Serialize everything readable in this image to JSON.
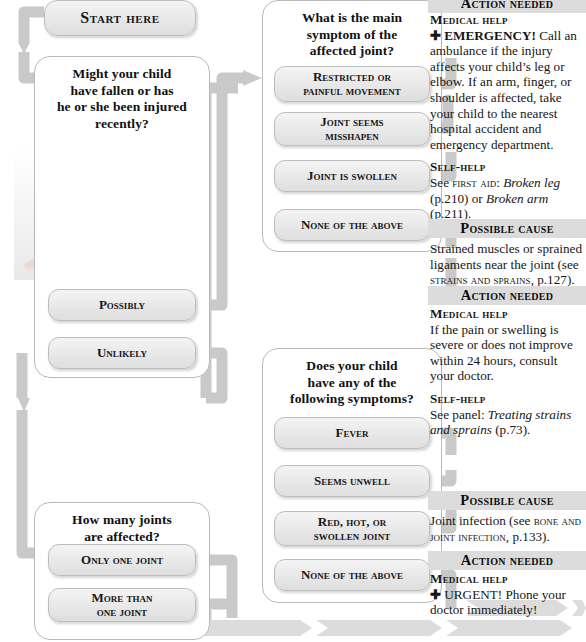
{
  "flowchart": {
    "start_label": "Start here",
    "questions": [
      {
        "id": "injury",
        "title": "Might your child\nhave fallen or has\nhe or she been injured\nrecently?",
        "answers": [
          "Possibly",
          "Unlikely"
        ]
      },
      {
        "id": "main-symptom",
        "title": "What is the main\nsymptom of the\naffected joint?",
        "answers": [
          "Restricted or\npainful movement",
          "Joint seems\nmisshapen",
          "Joint is swollen",
          "None of the above"
        ]
      },
      {
        "id": "following-symptoms",
        "title": "Does your child\nhave any of the\nfollowing symptoms?",
        "answers": [
          "Fever",
          "Seems unwell",
          "Red, hot, or\nswollen joint",
          "None of the above"
        ]
      },
      {
        "id": "joint-count",
        "title": "How many joints\nare affected?",
        "answers": [
          "Only one joint",
          "More than\none joint"
        ]
      }
    ],
    "photo_alt": "Woman kneeling beside an injured girl sitting on the floor"
  },
  "advice": [
    {
      "id": "action-emergency",
      "header": "Action needed",
      "blocks": [
        {
          "label": "Medical help",
          "symbol": "✚",
          "lead": "EMERGENCY!",
          "text": " Call an ambulance if the injury affects your child’s leg or elbow. If an arm, finger, or shoulder is affected, take your child to the nearest hospital accident and emergency department."
        },
        {
          "label": "Self-help",
          "text_parts": [
            {
              "t": "See ",
              "style": "normal"
            },
            {
              "t": "first aid",
              "style": "smallcaps"
            },
            {
              "t": ": ",
              "style": "normal"
            },
            {
              "t": "Broken leg",
              "style": "italic"
            },
            {
              "t": " (p.210) or ",
              "style": "normal"
            },
            {
              "t": "Broken arm",
              "style": "italic"
            },
            {
              "t": " (p.211).",
              "style": "normal"
            }
          ]
        }
      ]
    },
    {
      "id": "cause-strain",
      "header": "Possible cause",
      "blocks": [
        {
          "text_parts": [
            {
              "t": "Strained muscles or sprained ligaments near the joint (see ",
              "style": "normal"
            },
            {
              "t": "strains and sprains",
              "style": "smallcaps"
            },
            {
              "t": ", p.127).",
              "style": "normal"
            }
          ]
        }
      ]
    },
    {
      "id": "action-strain",
      "header": "Action needed",
      "blocks": [
        {
          "label": "Medical help",
          "text": "If the pain or swelling is severe or does not improve within 24 hours, consult your doctor."
        },
        {
          "label": "Self-help",
          "text_parts": [
            {
              "t": "See panel: ",
              "style": "normal"
            },
            {
              "t": "Treating strains and sprains",
              "style": "italic"
            },
            {
              "t": " (p.73).",
              "style": "normal"
            }
          ]
        }
      ]
    },
    {
      "id": "cause-infection",
      "header": "Possible cause",
      "blocks": [
        {
          "text_parts": [
            {
              "t": "Joint infection (see ",
              "style": "normal"
            },
            {
              "t": "bone and joint infection",
              "style": "smallcaps"
            },
            {
              "t": ", p.133).",
              "style": "normal"
            }
          ]
        }
      ]
    },
    {
      "id": "action-infection",
      "header": "Action needed",
      "blocks": [
        {
          "label": "Medical help",
          "symbol": "✚",
          "lead": "URGENT!",
          "text": " Phone your doctor immediately!"
        }
      ]
    }
  ],
  "colors": {
    "connector": "#c9c9c9",
    "header_bar": "#dcdcdc",
    "pill_border": "#bdbdbd",
    "box_border": "#b9b9b9",
    "text": "#111111"
  }
}
